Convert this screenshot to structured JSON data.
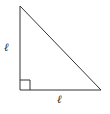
{
  "diagram": {
    "shape": "right isosceles triangle",
    "vertices": {
      "top": [
        20,
        6
      ],
      "right_angle": [
        20,
        90
      ],
      "bottom_right": [
        101,
        90
      ]
    },
    "labels": {
      "left_leg": "ℓ",
      "bottom_leg": "ℓ"
    },
    "right_angle_marker": true,
    "stroke_color": "#333333"
  }
}
